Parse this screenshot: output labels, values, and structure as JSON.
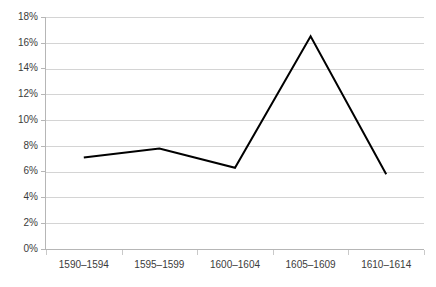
{
  "chart_data": {
    "type": "line",
    "title": "",
    "subtitle": "",
    "xlabel": "",
    "ylabel": "",
    "categories": [
      "1590–1594",
      "1595–1599",
      "1600–1604",
      "1605–1609",
      "1610–1614"
    ],
    "values": [
      7.1,
      7.8,
      6.3,
      16.5,
      5.8
    ],
    "series": [
      {
        "name": "",
        "values": [
          7.1,
          7.8,
          6.3,
          16.5,
          5.8
        ]
      }
    ],
    "ytick_labels": [
      "0%",
      "2%",
      "4%",
      "6%",
      "8%",
      "10%",
      "12%",
      "14%",
      "16%",
      "18%"
    ],
    "ytick_values": [
      0,
      2,
      4,
      6,
      8,
      10,
      12,
      14,
      16,
      18
    ],
    "ylim": [
      0,
      18
    ],
    "ytick_step": 2,
    "value_unit": "%",
    "grid": true,
    "grid_axis": "y",
    "legend": false,
    "legend_position": "none",
    "markers": false,
    "colors": {
      "line": "#000000",
      "gridline": "#d4d4d4",
      "axis": "#b6b6b6",
      "tick_label": "#3b3b3b",
      "background": "#ffffff"
    }
  }
}
